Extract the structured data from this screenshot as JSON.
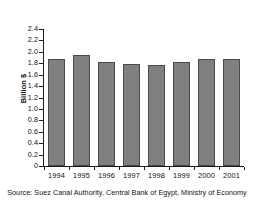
{
  "chart_data": {
    "type": "bar",
    "title": "",
    "subtitle": "",
    "xlabel": "",
    "ylabel": "Billion $",
    "categories": [
      "1994",
      "1995",
      "1996",
      "1997",
      "1998",
      "1999",
      "2000",
      "2001"
    ],
    "values": [
      1.87,
      1.94,
      1.83,
      1.79,
      1.77,
      1.82,
      1.87,
      1.87
    ],
    "series": [
      {
        "name": "Suez Canal revenues",
        "values": [
          1.87,
          1.94,
          1.83,
          1.79,
          1.77,
          1.82,
          1.87,
          1.87
        ]
      }
    ],
    "ylim": [
      0,
      2.4
    ],
    "ytick_step": 0.2,
    "ytick_labels": [
      "2.4",
      "2.2",
      "2.0",
      "1.8",
      "1.6",
      "1.4",
      "1.2",
      "1.0",
      "0.8",
      "0.6",
      "0.4",
      "0.2",
      "0"
    ],
    "ytick_values": [
      2.4,
      2.2,
      2.0,
      1.8,
      1.6,
      1.4,
      1.2,
      1.0,
      0.8,
      0.6,
      0.4,
      0.2,
      0
    ],
    "grid": false,
    "legend": false,
    "legend_position": "none",
    "bar_color": "#808080",
    "bar_edge_color": "#4a4a4a",
    "axis_color": "#1a1a1a",
    "background_color": "#ffffff",
    "annotations": []
  },
  "source": {
    "note": "Source: Suez Canal Authority, Central Bank of Egypt, Ministry of Economy"
  }
}
